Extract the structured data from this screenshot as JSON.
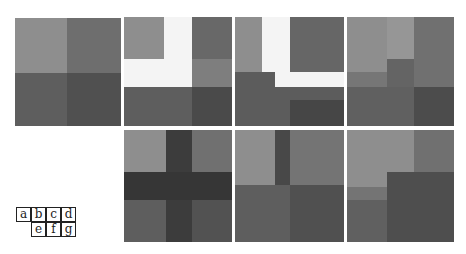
{
  "figure": {
    "colors": {
      "white": "#f7f7f7",
      "light": "#929292",
      "light2": "#9c9c9c",
      "medium": "#767676",
      "medium_dark": "#626262",
      "dark": "#545454",
      "darker": "#484848",
      "darkest": "#3a3a3a"
    }
  },
  "panels": [
    {
      "id": "a",
      "x": 15,
      "y": 18,
      "w": 106,
      "h": 108,
      "blocks": [
        {
          "x": 0,
          "y": 0,
          "w": 52,
          "h": 55,
          "c": "#8e8e8e"
        },
        {
          "x": 52,
          "y": 0,
          "w": 54,
          "h": 55,
          "c": "#6e6e6e"
        },
        {
          "x": 0,
          "y": 55,
          "w": 52,
          "h": 53,
          "c": "#5e5e5e"
        },
        {
          "x": 52,
          "y": 55,
          "w": 54,
          "h": 53,
          "c": "#505050"
        }
      ]
    },
    {
      "id": "b",
      "x": 124,
      "y": 17,
      "w": 108,
      "h": 109,
      "blocks": [
        {
          "x": 0,
          "y": 0,
          "w": 108,
          "h": 109,
          "c": "#f4f4f4"
        },
        {
          "x": 0,
          "y": 0,
          "w": 40,
          "h": 42,
          "c": "#8e8e8e"
        },
        {
          "x": 68,
          "y": 0,
          "w": 40,
          "h": 42,
          "c": "#686868"
        },
        {
          "x": 68,
          "y": 42,
          "w": 40,
          "h": 28,
          "c": "#7e7e7e"
        },
        {
          "x": 0,
          "y": 70,
          "w": 68,
          "h": 39,
          "c": "#5e5e5e"
        },
        {
          "x": 68,
          "y": 70,
          "w": 40,
          "h": 39,
          "c": "#4a4a4a"
        }
      ]
    },
    {
      "id": "c",
      "x": 235,
      "y": 17,
      "w": 109,
      "h": 109,
      "blocks": [
        {
          "x": 0,
          "y": 0,
          "w": 109,
          "h": 109,
          "c": "#f4f4f4"
        },
        {
          "x": 0,
          "y": 0,
          "w": 27,
          "h": 55,
          "c": "#8e8e8e"
        },
        {
          "x": 55,
          "y": 0,
          "w": 54,
          "h": 55,
          "c": "#666666"
        },
        {
          "x": 0,
          "y": 55,
          "w": 40,
          "h": 54,
          "c": "#5c5c5c"
        },
        {
          "x": 0,
          "y": 70,
          "w": 109,
          "h": 39,
          "c": "#5c5c5c"
        },
        {
          "x": 55,
          "y": 83,
          "w": 54,
          "h": 26,
          "c": "#464646"
        }
      ]
    },
    {
      "id": "d",
      "x": 347,
      "y": 17,
      "w": 107,
      "h": 109,
      "blocks": [
        {
          "x": 0,
          "y": 0,
          "w": 67,
          "h": 55,
          "c": "#8e8e8e"
        },
        {
          "x": 40,
          "y": 0,
          "w": 27,
          "h": 42,
          "c": "#969696"
        },
        {
          "x": 67,
          "y": 0,
          "w": 40,
          "h": 70,
          "c": "#707070"
        },
        {
          "x": 40,
          "y": 42,
          "w": 27,
          "h": 28,
          "c": "#646464"
        },
        {
          "x": 0,
          "y": 55,
          "w": 40,
          "h": 15,
          "c": "#767676"
        },
        {
          "x": 0,
          "y": 70,
          "w": 67,
          "h": 39,
          "c": "#606060"
        },
        {
          "x": 67,
          "y": 70,
          "w": 40,
          "h": 39,
          "c": "#4c4c4c"
        }
      ]
    },
    {
      "id": "e",
      "x": 124,
      "y": 130,
      "w": 108,
      "h": 112,
      "blocks": [
        {
          "x": 0,
          "y": 0,
          "w": 42,
          "h": 42,
          "c": "#8e8e8e"
        },
        {
          "x": 68,
          "y": 0,
          "w": 40,
          "h": 42,
          "c": "#707070"
        },
        {
          "x": 0,
          "y": 70,
          "w": 42,
          "h": 42,
          "c": "#5e5e5e"
        },
        {
          "x": 68,
          "y": 70,
          "w": 40,
          "h": 42,
          "c": "#525252"
        },
        {
          "x": 42,
          "y": 0,
          "w": 26,
          "h": 112,
          "c": "#3c3c3c"
        },
        {
          "x": 0,
          "y": 42,
          "w": 108,
          "h": 28,
          "c": "#363636"
        }
      ]
    },
    {
      "id": "f",
      "x": 235,
      "y": 130,
      "w": 109,
      "h": 112,
      "blocks": [
        {
          "x": 0,
          "y": 0,
          "w": 40,
          "h": 55,
          "c": "#8e8e8e"
        },
        {
          "x": 40,
          "y": 0,
          "w": 15,
          "h": 55,
          "c": "#484848"
        },
        {
          "x": 55,
          "y": 0,
          "w": 54,
          "h": 55,
          "c": "#747474"
        },
        {
          "x": 0,
          "y": 55,
          "w": 55,
          "h": 57,
          "c": "#5e5e5e"
        },
        {
          "x": 55,
          "y": 55,
          "w": 54,
          "h": 57,
          "c": "#505050"
        }
      ]
    },
    {
      "id": "g",
      "x": 347,
      "y": 130,
      "w": 107,
      "h": 112,
      "blocks": [
        {
          "x": 0,
          "y": 0,
          "w": 67,
          "h": 57,
          "c": "#8e8e8e"
        },
        {
          "x": 67,
          "y": 0,
          "w": 40,
          "h": 42,
          "c": "#707070"
        },
        {
          "x": 0,
          "y": 57,
          "w": 40,
          "h": 13,
          "c": "#747474"
        },
        {
          "x": 0,
          "y": 70,
          "w": 40,
          "h": 42,
          "c": "#606060"
        },
        {
          "x": 40,
          "y": 42,
          "w": 67,
          "h": 70,
          "c": "#4e4e4e"
        }
      ]
    }
  ],
  "legend": {
    "cells": [
      {
        "label": "a",
        "col": 0,
        "row": 0
      },
      {
        "label": "b",
        "col": 1,
        "row": 0
      },
      {
        "label": "c",
        "col": 2,
        "row": 0
      },
      {
        "label": "d",
        "col": 3,
        "row": 0
      },
      {
        "label": "e",
        "col": 1,
        "row": 1
      },
      {
        "label": "f",
        "col": 2,
        "row": 1
      },
      {
        "label": "g",
        "col": 3,
        "row": 1
      }
    ]
  }
}
